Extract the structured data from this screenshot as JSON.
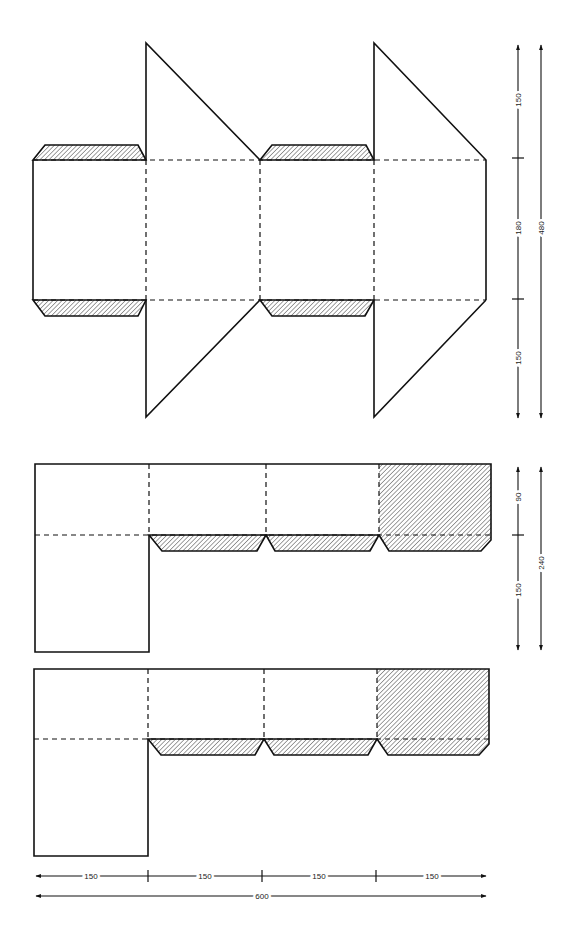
{
  "diagram": {
    "type": "box-net-template",
    "legend": {
      "hatched": "glue-flap",
      "solid_line": "cut-line",
      "dashed_line": "fold-line"
    },
    "colors": {
      "line": "#111111",
      "hatch": "#777777",
      "background": "#ffffff"
    },
    "top_net": {
      "dimensions": {
        "segment_top": "150",
        "segment_middle": "180",
        "segment_bottom": "150",
        "total": "480"
      }
    },
    "middle_net": {
      "dimensions": {
        "segment_top": "90",
        "segment_bottom": "150",
        "total": "240"
      }
    },
    "bottom_dimensions": {
      "segments": [
        "150",
        "150",
        "150",
        "150"
      ],
      "total": "600"
    }
  }
}
